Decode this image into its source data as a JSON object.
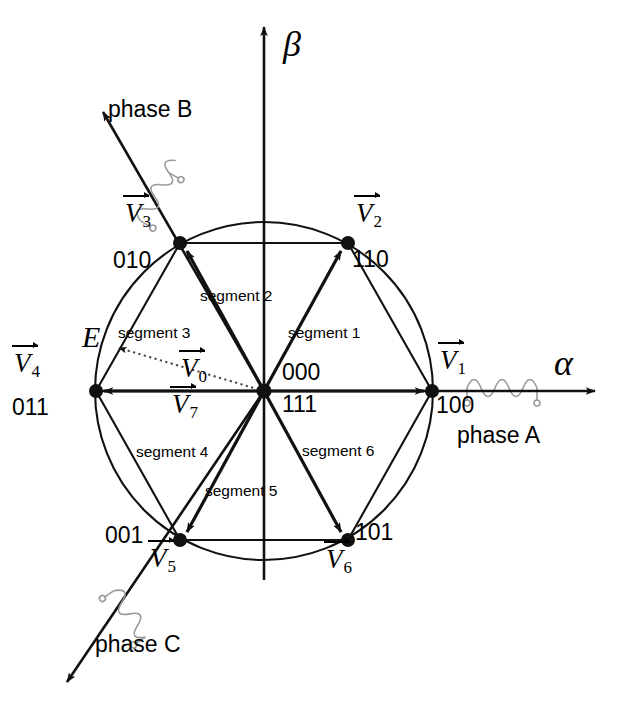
{
  "figure": {
    "axes": {
      "alpha": "α",
      "beta": "β"
    },
    "origin": {
      "x": 264,
      "y": 391
    },
    "radius": 168,
    "colors": {
      "line": "#111111",
      "coil": "#9a9a9a",
      "dotted": "#555555"
    }
  },
  "vectors": [
    {
      "id": "V1",
      "label": "V",
      "sub": "1",
      "code": "100",
      "angle_deg": 0,
      "tip": {
        "x": 432,
        "y": 391
      }
    },
    {
      "id": "V2",
      "label": "V",
      "sub": "2",
      "code": "110",
      "angle_deg": 60,
      "tip": {
        "x": 348,
        "y": 243
      }
    },
    {
      "id": "V3",
      "label": "V",
      "sub": "3",
      "code": "010",
      "angle_deg": 120,
      "tip": {
        "x": 180,
        "y": 243
      }
    },
    {
      "id": "V4",
      "label": "V",
      "sub": "4",
      "code": "011",
      "angle_deg": 180,
      "tip": {
        "x": 96,
        "y": 391
      }
    },
    {
      "id": "V5",
      "label": "V",
      "sub": "5",
      "code": "001",
      "angle_deg": 240,
      "tip": {
        "x": 180,
        "y": 540
      }
    },
    {
      "id": "V6",
      "label": "V",
      "sub": "6",
      "code": "101",
      "angle_deg": 300,
      "tip": {
        "x": 348,
        "y": 540
      }
    }
  ],
  "zero_vectors": [
    {
      "id": "V0",
      "label": "V",
      "sub": "0",
      "code": "000"
    },
    {
      "id": "V7",
      "label": "V",
      "sub": "7",
      "code": "111"
    }
  ],
  "segments": [
    {
      "id": "segment1",
      "label": "segment 1"
    },
    {
      "id": "segment2",
      "label": "segment 2"
    },
    {
      "id": "segment3",
      "label": "segment 3"
    },
    {
      "id": "segment4",
      "label": "segment 4"
    },
    {
      "id": "segment5",
      "label": "segment 5"
    },
    {
      "id": "segment6",
      "label": "segment 6"
    }
  ],
  "phases": [
    {
      "id": "phaseA",
      "label": "phase A",
      "angle_deg": 0
    },
    {
      "id": "phaseB",
      "label": "phase B",
      "angle_deg": 120
    },
    {
      "id": "phaseC",
      "label": "phase C",
      "angle_deg": 240
    }
  ],
  "reference_vector": {
    "id": "E",
    "label": "E",
    "style": "dotted",
    "tip": {
      "x": 110,
      "y": 345
    }
  }
}
